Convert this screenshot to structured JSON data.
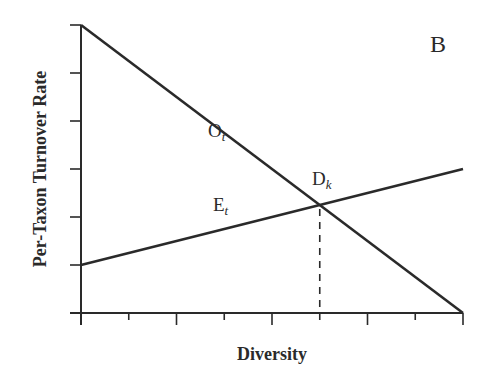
{
  "chart_data": {
    "type": "line",
    "title": "",
    "panel_label": "B",
    "xlabel": "Diversity",
    "ylabel": "Per-Taxon Turnover Rate",
    "xlim": [
      0,
      8
    ],
    "ylim": [
      0,
      6
    ],
    "x_ticks": [
      0,
      1,
      2,
      3,
      4,
      5,
      6,
      7,
      8
    ],
    "y_ticks": [
      0,
      1,
      2,
      3,
      4,
      5,
      6
    ],
    "tick_labels_shown": false,
    "grid": false,
    "series": [
      {
        "name": "O",
        "subscript": "t",
        "x": [
          0,
          8
        ],
        "y": [
          6,
          0
        ],
        "description": "origination rate, declining with diversity"
      },
      {
        "name": "E",
        "subscript": "t",
        "x": [
          0,
          8
        ],
        "y": [
          1,
          3
        ],
        "description": "extinction rate, rising with diversity"
      }
    ],
    "annotations": [
      {
        "text": "D",
        "subscript": "k",
        "x": 5,
        "y": 2.25,
        "description": "equilibrium diversity at intersection; dashed drop line to x-axis"
      }
    ],
    "colors": {
      "line": "#2a2a2a",
      "background": "#ffffff"
    }
  }
}
